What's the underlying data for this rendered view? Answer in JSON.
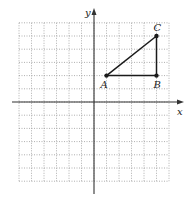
{
  "figure": {
    "type": "coordinate-plane-triangle",
    "grid": {
      "xmin": -6,
      "xmax": 6,
      "ymin": -6,
      "ymax": 6,
      "step": 1,
      "style": "dotted"
    },
    "axes": {
      "x_label": "x",
      "y_label": "y"
    },
    "points": [
      {
        "label": "A",
        "x": 1,
        "y": 2
      },
      {
        "label": "B",
        "x": 5,
        "y": 2
      },
      {
        "label": "C",
        "x": 5,
        "y": 5
      }
    ],
    "segments": [
      [
        "A",
        "B"
      ],
      [
        "B",
        "C"
      ],
      [
        "A",
        "C"
      ]
    ],
    "colors": {
      "grid": "#9a9a9a",
      "axis": "#333333",
      "triangle": "#1a1a1a"
    }
  }
}
